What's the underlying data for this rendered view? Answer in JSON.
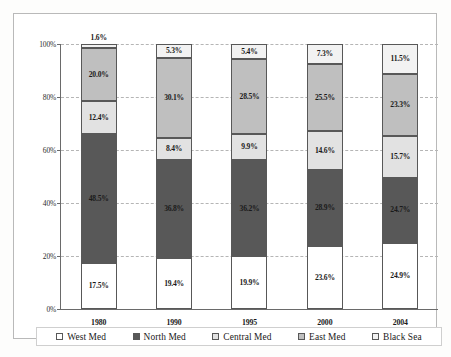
{
  "chart_data": {
    "type": "bar",
    "subtype": "stacked-percentage",
    "title": "",
    "subtitle": "",
    "xlabel": "",
    "ylabel": "",
    "categories": [
      "1980",
      "1990",
      "1995",
      "2000",
      "2004"
    ],
    "ylim": [
      0,
      100
    ],
    "yticks": [
      "0%",
      "20%",
      "40%",
      "60%",
      "80%",
      "100%"
    ],
    "ytick_values": [
      0,
      20,
      40,
      60,
      80,
      100
    ],
    "grid": true,
    "grid_style": "horizontal-dashed",
    "legend_position": "bottom",
    "stack_order_bottom_to_top": [
      "West Med",
      "North Med",
      "Central Med",
      "East Med",
      "Black Sea"
    ],
    "series": [
      {
        "name": "West Med",
        "fill": "crosshatch",
        "color": "#ffffff",
        "values": [
          17.5,
          19.4,
          19.9,
          23.6,
          24.9
        ],
        "labels": [
          "17.5%",
          "19.4%",
          "19.9%",
          "23.6%",
          "24.9%"
        ]
      },
      {
        "name": "North Med",
        "fill": "solid-dark",
        "color": "#585858",
        "values": [
          48.5,
          36.8,
          36.2,
          28.9,
          24.7
        ],
        "labels": [
          "48.5%",
          "36.8%",
          "36.2%",
          "28.9%",
          "24.7%"
        ]
      },
      {
        "name": "Central Med",
        "fill": "solid-light",
        "color": "#e2e2e2",
        "values": [
          12.4,
          8.4,
          9.9,
          14.6,
          15.7
        ],
        "labels": [
          "12.4%",
          "8.4%",
          "9.9%",
          "14.6%",
          "15.7%"
        ]
      },
      {
        "name": "East Med",
        "fill": "dotted-medium",
        "color": "#bfbfbf",
        "values": [
          20.0,
          30.1,
          28.5,
          25.5,
          23.3
        ],
        "labels": [
          "20.0%",
          "30.1%",
          "28.5%",
          "25.5%",
          "23.3%"
        ]
      },
      {
        "name": "Black Sea",
        "fill": "solid-very-light",
        "color": "#f2f2f2",
        "values": [
          1.6,
          5.3,
          5.4,
          7.3,
          11.5
        ],
        "labels": [
          "1.6%",
          "5.3%",
          "5.4%",
          "7.3%",
          "11.5%"
        ]
      }
    ]
  },
  "legend": {
    "items": [
      {
        "label": "West Med",
        "swatch": "legend-swatch-west-med"
      },
      {
        "label": "North Med",
        "swatch": "legend-swatch-north-med"
      },
      {
        "label": "Central Med",
        "swatch": "legend-swatch-central-med"
      },
      {
        "label": "East Med",
        "swatch": "legend-swatch-east-med"
      },
      {
        "label": "Black Sea",
        "swatch": "legend-swatch-black-sea"
      }
    ]
  }
}
